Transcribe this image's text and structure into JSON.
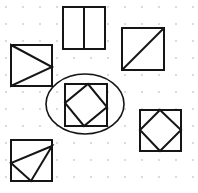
{
  "document": {
    "title": "Geometry Figures on Dot Grid",
    "width": 198,
    "height": 193,
    "background_color": "#ffffff",
    "ink_color": "#151515",
    "grid_dot_color": "#c9c9cf"
  },
  "grid": {
    "name": "dot-grid",
    "spacing": 17,
    "origin_x": 6,
    "origin_y": 7,
    "columns": 12,
    "rows": 12,
    "dot_radius": 0.9
  },
  "figures": [
    {
      "id": "figure-top-middle",
      "label": "Rectangle divided by a vertical line",
      "shape": "rectangle",
      "inner": "vertical-bisector",
      "x": 63,
      "y": 7,
      "width": 42,
      "height": 42,
      "inner_lines": [
        {
          "x1": 84,
          "y1": 7,
          "x2": 84,
          "y2": 49
        }
      ]
    },
    {
      "id": "figure-top-right",
      "label": "Square with diagonal from bottom-left to top-right",
      "shape": "square",
      "inner": "diagonal",
      "x": 122,
      "y": 28,
      "width": 42,
      "height": 42,
      "inner_lines": [
        {
          "x1": 122,
          "y1": 70,
          "x2": 164,
          "y2": 28
        }
      ]
    },
    {
      "id": "figure-left",
      "label": "Square with triangle pointing right",
      "shape": "square",
      "inner": "triangle",
      "x": 11,
      "y": 45,
      "width": 41,
      "height": 41,
      "inner_polygon": [
        {
          "x": 11,
          "y": 45
        },
        {
          "x": 52,
          "y": 67
        },
        {
          "x": 11,
          "y": 86
        }
      ]
    },
    {
      "id": "figure-center",
      "label": "Square with inscribed tilted square, circled",
      "shape": "square",
      "inner": "tilted-square",
      "x": 65,
      "y": 84,
      "width": 42,
      "height": 42,
      "inner_polygon": [
        {
          "x": 88,
          "y": 84
        },
        {
          "x": 107,
          "y": 107
        },
        {
          "x": 84,
          "y": 126
        },
        {
          "x": 65,
          "y": 103
        }
      ],
      "circled": true
    },
    {
      "id": "figure-bottom-right",
      "label": "Square with inscribed diamond touching midpoints",
      "shape": "square",
      "inner": "diamond",
      "x": 140,
      "y": 110,
      "width": 41,
      "height": 41,
      "inner_polygon": [
        {
          "x": 160,
          "y": 110
        },
        {
          "x": 181,
          "y": 130
        },
        {
          "x": 160,
          "y": 151
        },
        {
          "x": 140,
          "y": 130
        }
      ]
    },
    {
      "id": "figure-bottom-left",
      "label": "Square with triangle from top-right to left-mid to bottom-mid",
      "shape": "square",
      "inner": "triangle",
      "x": 11,
      "y": 140,
      "width": 41,
      "height": 41,
      "inner_polygon": [
        {
          "x": 52,
          "y": 146
        },
        {
          "x": 11,
          "y": 163
        },
        {
          "x": 31,
          "y": 181
        }
      ]
    }
  ],
  "annotation": {
    "id": "selection-ellipse",
    "label": "Hand-drawn ellipse circling the center figure",
    "center_x": 85,
    "center_y": 104,
    "radius_x": 39,
    "radius_y": 30
  }
}
